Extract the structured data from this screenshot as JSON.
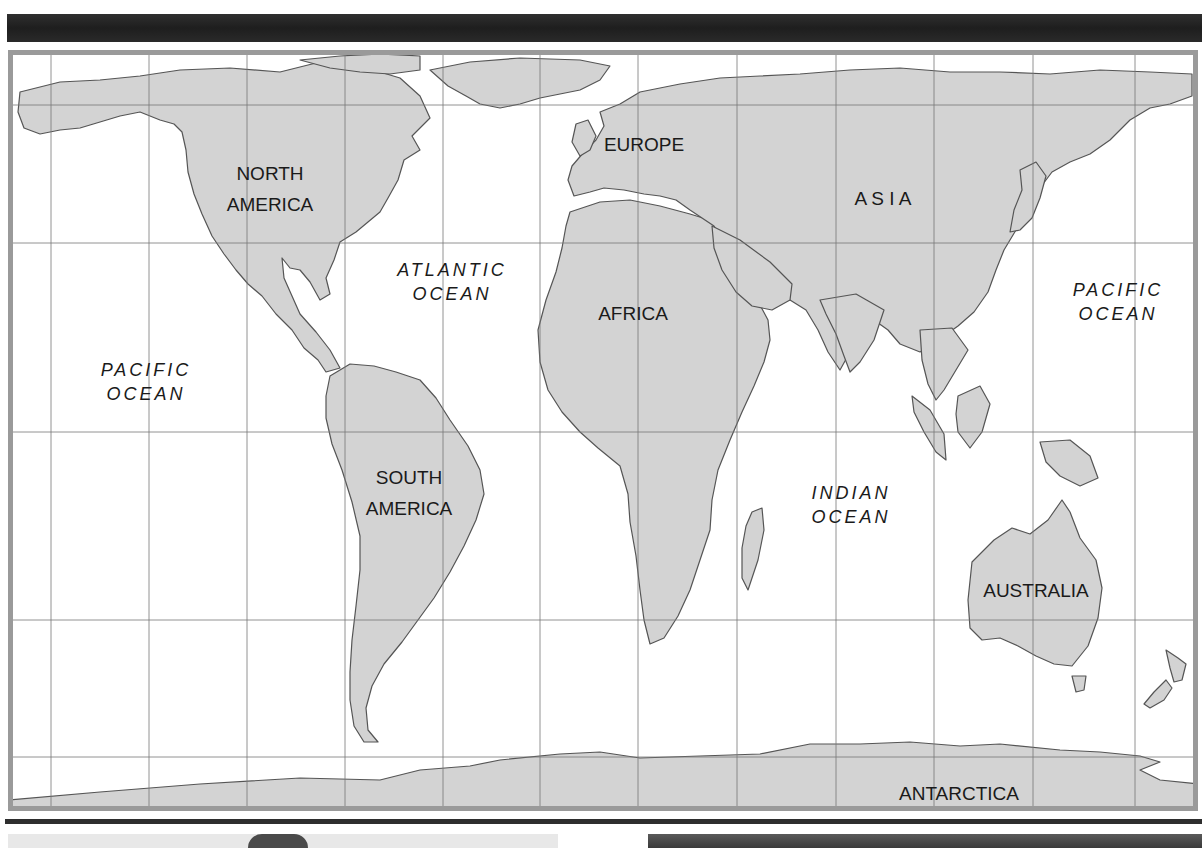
{
  "map": {
    "title": "World Map",
    "colors": {
      "land": "#d3d3d3",
      "coast": "#555555",
      "grid": "#777777",
      "frame": "#9a9a9a",
      "water": "#ffffff",
      "label": "#1a1a1a"
    },
    "grid": {
      "vertical_x": [
        51,
        149,
        247,
        345,
        443,
        540,
        638,
        737,
        836,
        934,
        1033,
        1135
      ],
      "horizontal_y": [
        105,
        243,
        432,
        620,
        757
      ]
    },
    "continent_labels": [
      {
        "id": "north-america",
        "lines": [
          "NORTH",
          "AMERICA"
        ],
        "x": 270,
        "y": 180
      },
      {
        "id": "south-america",
        "lines": [
          "SOUTH",
          "AMERICA"
        ],
        "x": 409,
        "y": 484
      },
      {
        "id": "europe",
        "lines": [
          "EUROPE"
        ],
        "x": 644,
        "y": 151
      },
      {
        "id": "asia",
        "lines": [
          "A S I A"
        ],
        "x": 883,
        "y": 205
      },
      {
        "id": "africa",
        "lines": [
          "AFRICA"
        ],
        "x": 633,
        "y": 320
      },
      {
        "id": "australia",
        "lines": [
          "AUSTRALIA"
        ],
        "x": 1036,
        "y": 597
      },
      {
        "id": "antarctica",
        "lines": [
          "ANTARCTICA"
        ],
        "x": 959,
        "y": 800
      }
    ],
    "ocean_labels": [
      {
        "id": "pacific-ocean-west",
        "lines": [
          "PACIFIC",
          "OCEAN"
        ],
        "x": 146,
        "y": 376
      },
      {
        "id": "atlantic-ocean",
        "lines": [
          "ATLANTIC",
          "OCEAN"
        ],
        "x": 452,
        "y": 276
      },
      {
        "id": "indian-ocean",
        "lines": [
          "INDIAN",
          "OCEAN"
        ],
        "x": 851,
        "y": 499
      },
      {
        "id": "pacific-ocean-east",
        "lines": [
          "PACIFIC",
          "OCEAN"
        ],
        "x": 1118,
        "y": 296
      }
    ],
    "landmasses": {
      "north_america": "20,92 60,82 100,80 140,76 180,70 230,68 280,72 320,62 360,66 400,78 420,96 430,118 412,136 420,150 404,160 398,180 388,198 380,212 368,222 356,232 340,242 334,260 326,278 330,294 320,300 310,282 300,270 290,268 282,258 284,278 292,296 300,314 316,332 330,350 340,368 326,372 318,360 304,348 292,330 276,314 262,296 248,284 236,270 224,254 212,236 202,214 194,194 188,172 186,150 182,132 174,124 160,120 140,112 120,116 100,122 80,128 60,130 40,134 24,128 18,112",
      "greenland": "430,70 470,62 520,58 580,60 610,66 600,80 580,90 560,94 540,98 520,104 500,108 480,104 466,96 448,86",
      "arctic_islands": "300,60 340,56 380,54 420,56 420,70 390,74 360,72 330,68",
      "south_america": "330,376 350,364 374,366 396,372 420,380 436,398 450,420 468,446 480,470 484,494 476,520 464,546 450,572 434,598 418,620 402,642 384,664 372,686 366,708 368,730 378,742 364,742 354,726 350,700 350,672 352,640 356,606 360,570 360,536 352,502 342,470 332,444 326,418 326,396",
      "africa": "570,212 600,202 630,200 660,206 690,214 716,222 726,238 738,262 752,290 768,320 770,340 764,362 754,386 742,412 730,440 718,470 712,500 710,530 700,560 690,590 678,616 664,638 650,644 644,620 640,590 636,556 630,522 628,494 620,466 598,448 580,432 562,412 548,390 540,362 538,330 546,300 556,272 562,248 566,226",
      "eurasia": "600,112 620,104 640,92 680,84 720,78 760,76 800,74 850,70 900,68 950,72 1000,72 1050,74 1100,70 1150,72 1192,74 1192,96 1170,104 1150,108 1130,120 1110,140 1090,154 1070,162 1052,172 1040,188 1030,210 1016,230 1004,250 996,270 988,292 974,312 958,326 944,336 930,346 920,352 900,344 888,330 874,320 860,330 850,352 840,370 828,352 818,330 806,310 790,300 772,294 760,300 748,282 736,262 724,240 714,226 702,218 690,210 676,200 660,196 644,194 624,190 604,188 590,192 574,196 568,180 572,166 584,152 596,140 604,126",
      "arabia": "712,226 740,240 770,262 792,284 790,300 772,310 752,306 736,292 722,270 714,248",
      "india": "820,300 856,294 884,310 874,340 860,362 850,372 844,356 836,334 826,314",
      "se_asia": "920,330 952,328 968,350 956,370 944,390 936,400 928,384 922,360",
      "sumatra": "912,396 930,410 944,434 946,460 936,452 924,432 914,412",
      "borneo": "958,396 980,386 990,404 982,432 970,448 958,432 956,414",
      "new_guinea": "1040,442 1070,440 1090,456 1098,478 1080,486 1060,476 1046,462",
      "japan": "1020,170 1036,162 1046,176 1040,198 1032,218 1020,230 1010,232 1014,210 1022,190",
      "madagascar": "752,512 762,508 764,530 758,560 748,590 742,578 742,548 746,526",
      "australia": "972,562 994,540 1012,528 1030,534 1048,520 1062,500 1070,512 1080,538 1096,560 1102,588 1098,618 1088,646 1072,666 1054,664 1036,656 1018,646 1000,638 982,640 970,628 968,600",
      "tasmania": "1072,676 1086,676 1084,690 1076,692",
      "new_zealand_n": "1166,650 1178,658 1186,664 1182,680 1174,682 1170,668",
      "new_zealand_s": "1166,680 1172,688 1164,700 1150,708 1144,704 1154,692",
      "british_isles": "576,124 588,120 596,136 590,150 580,156 572,142",
      "antarctica": "8,800 100,792 200,784 300,778 380,780 420,770 470,766 500,760 560,754 600,752 640,758 700,756 760,754 810,744 860,744 910,742 960,746 1000,744 1060,750 1100,752 1140,756 1160,762 1140,770 1160,780 1200,784 1200,812 8,812"
    }
  }
}
